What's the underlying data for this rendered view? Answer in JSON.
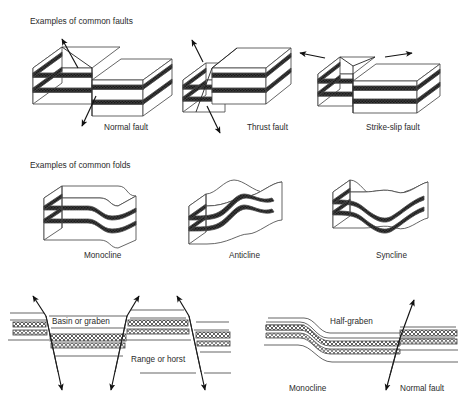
{
  "figure": {
    "title_implicit": "Common faults, folds and structural cross-sections",
    "background_color": "#ffffff",
    "line_color": "#4a4a4a",
    "bed_dark_color": "#2b2b2b",
    "bed_light_color": "#ffffff"
  },
  "sections": [
    {
      "id": "faults",
      "heading": "Examples of common faults",
      "heading_x": 30,
      "heading_y": 24,
      "items": [
        {
          "id": "normal-fault",
          "label": "Normal fault",
          "label_x": 104,
          "label_y": 130,
          "arrows": [
            "up-left-hanging-wall",
            "down-left-footwall"
          ],
          "description": "Block diagram with two offset blocks, extensional dip-slip"
        },
        {
          "id": "thrust-fault",
          "label": "Thrust fault",
          "label_x": 247,
          "label_y": 130,
          "arrows": [
            "up-left",
            "down-right"
          ],
          "description": "Block diagram with upper block pushed over lower block, compressional"
        },
        {
          "id": "strike-slip-fault",
          "label": "Strike-slip fault",
          "label_x": 366,
          "label_y": 130,
          "arrows": [
            "left-horizontal",
            "right-horizontal"
          ],
          "description": "Block diagram with lateral horizontal offset between blocks"
        }
      ]
    },
    {
      "id": "folds",
      "heading": "Examples of common folds",
      "heading_x": 30,
      "heading_y": 168,
      "items": [
        {
          "id": "monocline-fold",
          "label": "Monocline",
          "label_x": 84,
          "label_y": 258,
          "description": "Block with single step-like flexure in otherwise flat-lying beds"
        },
        {
          "id": "anticline-fold",
          "label": "Anticline",
          "label_x": 229,
          "label_y": 258,
          "description": "Block with upward-arching beds"
        },
        {
          "id": "syncline-fold",
          "label": "Syncline",
          "label_x": 376,
          "label_y": 258,
          "description": "Block with downward-troughing beds"
        }
      ]
    },
    {
      "id": "cross-sections",
      "heading": "",
      "items": [
        {
          "id": "basin-graben",
          "label": "Basin or graben",
          "label_x": 52,
          "label_y": 324,
          "description": "Down-dropped block between two normal faults"
        },
        {
          "id": "range-horst",
          "label": "Range or horst",
          "label_x": 131,
          "label_y": 362,
          "description": "Up-raised block between two normal faults"
        },
        {
          "id": "half-graben",
          "label": "Half-graben",
          "label_x": 330,
          "label_y": 324,
          "description": "Asymmetric basin bounded by one normal fault"
        },
        {
          "id": "monocline-section",
          "label": "Monocline",
          "label_x": 289,
          "label_y": 391,
          "description": "Step-like flexure in cross-section"
        },
        {
          "id": "normal-fault-section",
          "label": "Normal fault",
          "label_x": 385,
          "label_y": 391,
          "description": "Dip-slip fault offsetting beds in cross-section"
        }
      ]
    }
  ],
  "icons": {
    "arrow": "arrow-icon",
    "block": "block-diagram-icon",
    "strata": "strata-band-icon"
  }
}
